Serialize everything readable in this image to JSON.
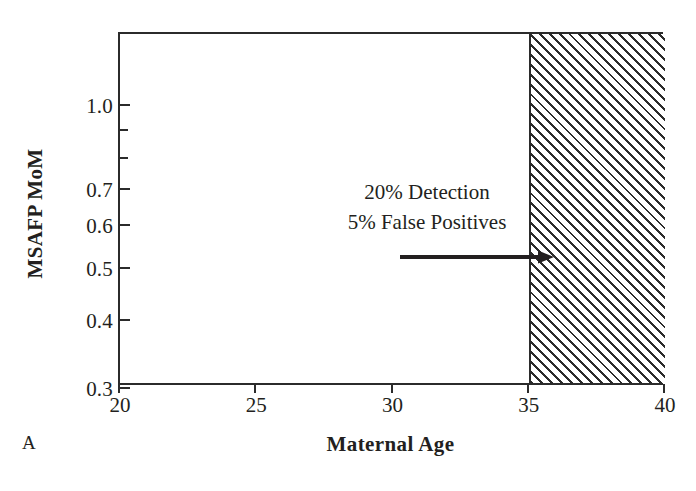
{
  "panel": {
    "letter": "A"
  },
  "axes": {
    "y_title": "MSAFP MoM",
    "x_title": "Maternal Age"
  },
  "annotation": {
    "line1": "20% Detection",
    "line2": "5% False Positives",
    "arrow_icon": "arrow-right-icon"
  },
  "colors": {
    "ink": "#231f20",
    "axis": "#2b2b2b",
    "background": "#ffffff",
    "hatch": "#2b2b2b"
  },
  "chart_data": {
    "type": "area",
    "title": "",
    "subtitle": "",
    "xlabel": "Maternal Age",
    "ylabel": "MSAFP MoM",
    "xlim": [
      20,
      40
    ],
    "ylim": [
      0.3,
      1.35
    ],
    "yscale": "log",
    "xscale": "linear",
    "grid": false,
    "legend": null,
    "x_ticks": [
      {
        "value": 20,
        "label": "20"
      },
      {
        "value": 25,
        "label": "25"
      },
      {
        "value": 30,
        "label": "30"
      },
      {
        "value": 35,
        "label": "35"
      },
      {
        "value": 40,
        "label": "40"
      }
    ],
    "y_ticks": [
      {
        "value": 1.0,
        "label": "1.0",
        "major": true
      },
      {
        "value": 0.9,
        "label": "",
        "major": false
      },
      {
        "value": 0.8,
        "label": "",
        "major": false
      },
      {
        "value": 0.7,
        "label": "0.7",
        "major": true
      },
      {
        "value": 0.6,
        "label": "0.6",
        "major": true
      },
      {
        "value": 0.5,
        "label": "0.5",
        "major": true
      },
      {
        "value": 0.4,
        "label": "0.4",
        "major": true
      },
      {
        "value": 0.3,
        "label": "0.3",
        "major": true
      }
    ],
    "shaded_regions": [
      {
        "name": "screen-positive-age-region",
        "x_start": 35,
        "x_end": 40,
        "y_start": 0.3,
        "y_end": 1.35,
        "fill": "diagonal-hatch",
        "hatch_direction": "forward-slash"
      }
    ],
    "annotations": [
      {
        "text": "20% Detection",
        "x": 27.5,
        "y": 0.82,
        "type": "text"
      },
      {
        "text": "5% False Positives",
        "x": 27.5,
        "y": 0.745,
        "type": "text"
      },
      {
        "type": "arrow",
        "x_start": 26.0,
        "x_end": 31.5,
        "y": 0.68,
        "direction": "right"
      }
    ]
  }
}
